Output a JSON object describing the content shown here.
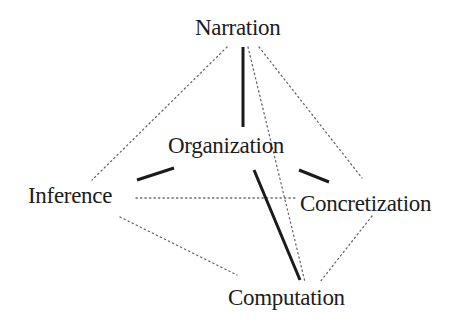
{
  "diagram": {
    "type": "tetrahedron-concept-map",
    "colors": {
      "solid_edge": "#1a1a1a",
      "dotted_edge": "#6a6a6a",
      "text": "#1c1c1c",
      "background": "#ffffff"
    },
    "nodes": [
      {
        "id": "narration",
        "label": "Narration",
        "x": 195,
        "y": 16
      },
      {
        "id": "organization",
        "label": "Organization",
        "x": 168,
        "y": 134
      },
      {
        "id": "inference",
        "label": "Inference",
        "x": 28,
        "y": 184
      },
      {
        "id": "concretization",
        "label": "Concretization",
        "x": 300,
        "y": 192
      },
      {
        "id": "computation",
        "label": "Computation",
        "x": 228,
        "y": 286
      }
    ],
    "solid_edges": [
      {
        "from": "organization",
        "to": "narration",
        "x1": 243,
        "y1": 47,
        "x2": 243,
        "y2": 127
      },
      {
        "from": "organization",
        "to": "inference",
        "x1": 137,
        "y1": 180,
        "x2": 174,
        "y2": 168
      },
      {
        "from": "organization",
        "to": "concretization",
        "x1": 299,
        "y1": 170,
        "x2": 329,
        "y2": 182
      },
      {
        "from": "organization",
        "to": "computation",
        "x1": 254,
        "y1": 170,
        "x2": 300,
        "y2": 280
      }
    ],
    "dotted_edges": [
      {
        "from": "narration",
        "to": "inference",
        "x1": 227,
        "y1": 47,
        "x2": 92,
        "y2": 180
      },
      {
        "from": "narration",
        "to": "concretization",
        "x1": 259,
        "y1": 47,
        "x2": 362,
        "y2": 178
      },
      {
        "from": "narration",
        "to": "computation",
        "x1": 248,
        "y1": 47,
        "x2": 305,
        "y2": 282
      },
      {
        "from": "inference",
        "to": "concretization",
        "x1": 136,
        "y1": 198,
        "x2": 297,
        "y2": 198
      },
      {
        "from": "inference",
        "to": "computation",
        "x1": 120,
        "y1": 217,
        "x2": 237,
        "y2": 275
      },
      {
        "from": "concretization",
        "to": "computation",
        "x1": 372,
        "y1": 216,
        "x2": 320,
        "y2": 282
      }
    ]
  }
}
